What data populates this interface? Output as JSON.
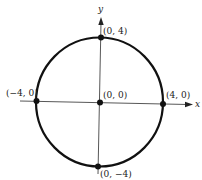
{
  "figure": {
    "type": "circle-on-axes",
    "colors": {
      "stroke": "#111111",
      "axis": "#333333",
      "text": "#222222",
      "background": "#ffffff"
    },
    "axes": {
      "x_label": "x",
      "y_label": "y"
    },
    "circle": {
      "center": [
        0,
        0
      ],
      "radius": 4,
      "equation_hint": "x^2 + y^2 = 16"
    },
    "points": [
      {
        "id": "top",
        "label": "(0, 4)",
        "coords": [
          0,
          4
        ]
      },
      {
        "id": "bottom",
        "label": "(0, −4)",
        "coords": [
          0,
          -4
        ]
      },
      {
        "id": "left",
        "label": "(−4, 0)",
        "coords": [
          -4,
          0
        ]
      },
      {
        "id": "right",
        "label": "(4, 0)",
        "coords": [
          4,
          0
        ]
      },
      {
        "id": "origin",
        "label": "(0, 0)",
        "coords": [
          0,
          0
        ]
      }
    ]
  }
}
